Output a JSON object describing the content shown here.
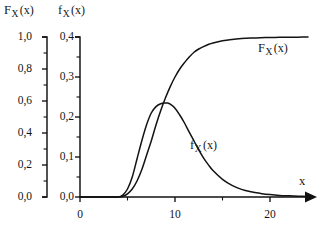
{
  "figure": {
    "width": 329,
    "height": 235,
    "background": "#ffffff",
    "ink_color": "#131313"
  },
  "headers": {
    "left_axis_header": {
      "base": "F",
      "sub": "X",
      "arg": "(x)"
    },
    "right_axis_header": {
      "base": "f",
      "sub": "X",
      "arg": "(x)"
    }
  },
  "curve_labels": {
    "cdf": {
      "base": "F",
      "sub": "X",
      "arg": "(x)"
    },
    "pdf": {
      "base": "f",
      "sub": "X",
      "arg": "(x)"
    }
  },
  "axis_label_x": "x",
  "ticks": {
    "left_y": [
      "1,0",
      "0,8",
      "0,6",
      "0,4",
      "0,2",
      "0,0"
    ],
    "right_y": [
      "0,4",
      "0,3",
      "0,2",
      "0,1",
      "0,0"
    ],
    "x": [
      "0",
      "10",
      "20"
    ]
  },
  "chart_data": {
    "type": "line",
    "title": "",
    "xlabel": "x",
    "ylabel": "F_X(x)",
    "ylabel_secondary": "f_X(x)",
    "grid": false,
    "legend": "inline-curve-labels",
    "xlim": [
      0,
      24
    ],
    "ylim_left": [
      0.0,
      1.0
    ],
    "ylim_right": [
      0.0,
      0.4
    ],
    "xticks": [
      0,
      10,
      20
    ],
    "xticks_minor": [
      5,
      15
    ],
    "yticks_left": [
      0.0,
      0.2,
      0.4,
      0.6,
      0.8,
      1.0
    ],
    "yticks_left_minor": [
      0.1,
      0.3,
      0.5,
      0.7,
      0.9
    ],
    "yticks_right": [
      0.0,
      0.1,
      0.2,
      0.3,
      0.4
    ],
    "yticks_right_minor": [
      0.05,
      0.15,
      0.25,
      0.35
    ],
    "series": [
      {
        "name": "F_X(x)",
        "axis": "left",
        "label_text": "F_X(x)",
        "x": [
          0,
          1,
          2,
          3,
          4,
          4.5,
          5,
          5.5,
          6,
          6.5,
          7,
          7.5,
          8,
          8.5,
          9,
          9.5,
          10,
          10.5,
          11,
          11.5,
          12,
          12.5,
          13,
          13.5,
          14,
          15,
          16,
          17,
          18,
          19,
          20,
          21,
          22,
          23,
          24
        ],
        "y": [
          0.0,
          0.0,
          0.0,
          0.0,
          0.0,
          0.005,
          0.02,
          0.05,
          0.1,
          0.17,
          0.26,
          0.35,
          0.45,
          0.54,
          0.62,
          0.69,
          0.75,
          0.8,
          0.84,
          0.875,
          0.905,
          0.925,
          0.94,
          0.953,
          0.963,
          0.977,
          0.985,
          0.99,
          0.993,
          0.995,
          0.997,
          0.998,
          0.999,
          0.999,
          1.0
        ]
      },
      {
        "name": "f_X(x)",
        "axis": "right",
        "label_text": "f_X(x)",
        "peak_x": 9.2,
        "peak_y": 0.235,
        "x": [
          0,
          1,
          2,
          3,
          4,
          4.5,
          5,
          5.5,
          6,
          6.5,
          7,
          7.5,
          8,
          8.5,
          9,
          9.2,
          9.5,
          10,
          10.5,
          11,
          11.5,
          12,
          12.5,
          13,
          13.5,
          14,
          15,
          16,
          17,
          18,
          19,
          20,
          21,
          22,
          23,
          24
        ],
        "y": [
          0.0,
          0.0,
          0.0,
          0.0,
          0.0,
          0.005,
          0.02,
          0.05,
          0.095,
          0.14,
          0.18,
          0.21,
          0.226,
          0.233,
          0.235,
          0.235,
          0.232,
          0.222,
          0.205,
          0.185,
          0.162,
          0.14,
          0.118,
          0.098,
          0.081,
          0.066,
          0.044,
          0.029,
          0.019,
          0.013,
          0.009,
          0.006,
          0.004,
          0.003,
          0.002,
          0.001
        ]
      }
    ]
  }
}
